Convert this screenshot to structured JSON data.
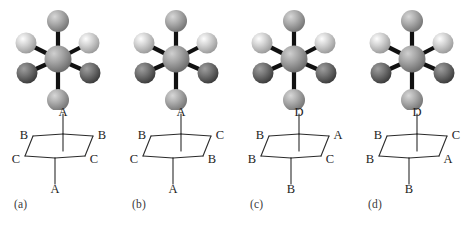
{
  "figure": {
    "kind": "newman-projection-figure",
    "panel_count": 4,
    "background_color": "#ffffff",
    "line_color": "#2b2b2b"
  },
  "sphere_palette": {
    "white": "#efefef",
    "light": "#c9c9c9",
    "light_medium": "#bdbdbd",
    "medium": "#a3a3a3",
    "medium_dark": "#8a8a8a",
    "dark": "#6a6a6a",
    "center": "#9b9b9b",
    "bond": "#111111"
  },
  "panels": [
    {
      "id": "a",
      "caption": "(a)",
      "model": {
        "center_tone": "center",
        "substituents": [
          {
            "position": "top",
            "tone": "medium"
          },
          {
            "position": "upper-left",
            "tone": "light"
          },
          {
            "position": "upper-right",
            "tone": "light"
          },
          {
            "position": "lower-left",
            "tone": "dark"
          },
          {
            "position": "lower-right",
            "tone": "dark"
          },
          {
            "position": "bottom",
            "tone": "medium"
          }
        ]
      },
      "newman": {
        "top": "A",
        "upper_left": "B",
        "upper_right": "B",
        "lower_left": "C",
        "lower_right": "C",
        "bottom": "A"
      }
    },
    {
      "id": "b",
      "caption": "(b)",
      "model": {
        "center_tone": "center",
        "substituents": [
          {
            "position": "top",
            "tone": "medium"
          },
          {
            "position": "upper-left",
            "tone": "light"
          },
          {
            "position": "upper-right",
            "tone": "dark"
          },
          {
            "position": "lower-left",
            "tone": "dark"
          },
          {
            "position": "lower-right",
            "tone": "light"
          },
          {
            "position": "bottom",
            "tone": "medium"
          }
        ]
      },
      "newman": {
        "top": "A",
        "upper_left": "B",
        "upper_right": "C",
        "lower_left": "C",
        "lower_right": "B",
        "bottom": "A"
      }
    },
    {
      "id": "c",
      "caption": "(c)",
      "model": {
        "center_tone": "center",
        "substituents": [
          {
            "position": "top",
            "tone": "white"
          },
          {
            "position": "upper-left",
            "tone": "medium"
          },
          {
            "position": "upper-right",
            "tone": "medium"
          },
          {
            "position": "lower-left",
            "tone": "light_medium"
          },
          {
            "position": "lower-right",
            "tone": "dark"
          },
          {
            "position": "bottom",
            "tone": "medium"
          }
        ]
      },
      "newman": {
        "top": "D",
        "upper_left": "B",
        "upper_right": "A",
        "lower_left": "B",
        "lower_right": "C",
        "bottom": "B"
      }
    },
    {
      "id": "d",
      "caption": "(d)",
      "model": {
        "center_tone": "center",
        "substituents": [
          {
            "position": "top",
            "tone": "white"
          },
          {
            "position": "upper-left",
            "tone": "light_medium"
          },
          {
            "position": "upper-right",
            "tone": "dark"
          },
          {
            "position": "lower-left",
            "tone": "light"
          },
          {
            "position": "lower-right",
            "tone": "medium"
          },
          {
            "position": "bottom",
            "tone": "medium"
          }
        ]
      },
      "newman": {
        "top": "D",
        "upper_left": "B",
        "upper_right": "C",
        "lower_left": "B",
        "lower_right": "A",
        "bottom": "B"
      }
    }
  ]
}
